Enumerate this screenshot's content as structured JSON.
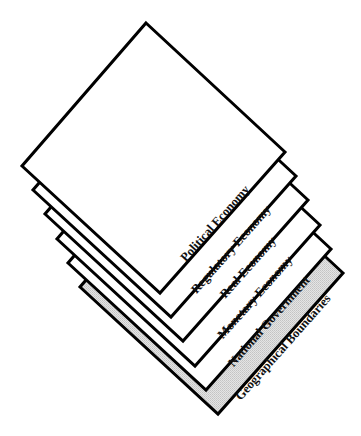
{
  "diagram": {
    "title": "",
    "type": "stacked-layers",
    "colors": {
      "stroke": "#000000",
      "layer_fill": "#ffffff",
      "base_fill": "#d9d9d9",
      "text": "#111111"
    },
    "layers": [
      {
        "label": "Political Economy",
        "position": "top"
      },
      {
        "label": "Regulatory Economy"
      },
      {
        "label": "Real Economy"
      },
      {
        "label": "Monetary Economy"
      },
      {
        "label": "National Government"
      },
      {
        "label": "Geographical Boundaries",
        "position": "bottom",
        "shaded": true
      }
    ]
  }
}
